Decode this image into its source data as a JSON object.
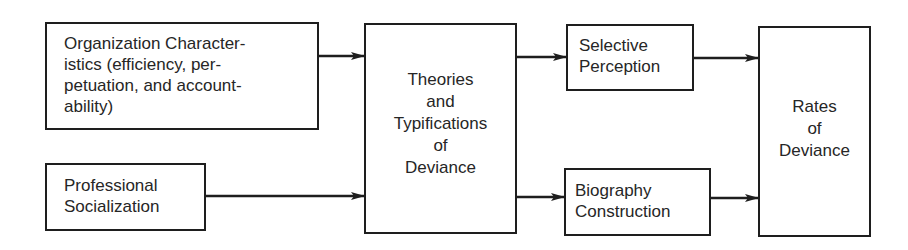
{
  "diagram": {
    "type": "flowchart",
    "nodes": [
      {
        "id": "org",
        "lines": [
          "Organization Character-",
          "istics (efficiency, per-",
          "petuation, and account-",
          "ability)"
        ]
      },
      {
        "id": "prof",
        "lines": [
          "Professional",
          "Socialization"
        ]
      },
      {
        "id": "theories",
        "lines": [
          "Theories",
          "and",
          "Typifications",
          "of",
          "Deviance"
        ]
      },
      {
        "id": "selective",
        "lines": [
          "Selective",
          "Perception"
        ]
      },
      {
        "id": "biography",
        "lines": [
          "Biography",
          "Construction"
        ]
      },
      {
        "id": "rates",
        "lines": [
          "Rates",
          "of",
          "Deviance"
        ]
      }
    ],
    "edges": [
      {
        "from": "org",
        "to": "theories"
      },
      {
        "from": "prof",
        "to": "theories"
      },
      {
        "from": "theories",
        "to": "selective"
      },
      {
        "from": "theories",
        "to": "biography"
      },
      {
        "from": "selective",
        "to": "rates"
      },
      {
        "from": "biography",
        "to": "rates"
      }
    ],
    "colors": {
      "stroke": "#1e1e1e",
      "text": "#262626",
      "background": "#ffffff"
    }
  }
}
